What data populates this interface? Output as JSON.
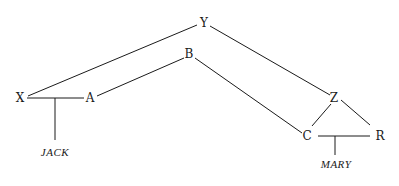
{
  "diagram": {
    "type": "graph",
    "nodes": {
      "X": {
        "label": "X",
        "x": 20,
        "y": 102
      },
      "A": {
        "label": "A",
        "x": 90,
        "y": 102
      },
      "Y": {
        "label": "Y",
        "x": 204,
        "y": 27
      },
      "B": {
        "label": "B",
        "x": 189,
        "y": 58
      },
      "Z": {
        "label": "Z",
        "x": 334,
        "y": 102
      },
      "C": {
        "label": "C",
        "x": 307,
        "y": 140
      },
      "R": {
        "label": "R",
        "x": 380,
        "y": 140
      }
    },
    "leaves": {
      "JACK": {
        "label": "JACK",
        "x": 55,
        "y": 156
      },
      "MARY": {
        "label": "MARY",
        "x": 336,
        "y": 168
      }
    },
    "edges": [
      {
        "from": "X",
        "to": "Y"
      },
      {
        "from": "X",
        "to": "A"
      },
      {
        "from": "A",
        "to": "B"
      },
      {
        "from": "B",
        "to": "C"
      },
      {
        "from": "Y",
        "to": "Z"
      },
      {
        "from": "Z",
        "to": "C"
      },
      {
        "from": "Z",
        "to": "R"
      },
      {
        "from": "C",
        "to": "R"
      },
      {
        "from": "X-A",
        "to": "JACK"
      },
      {
        "from": "C-R",
        "to": "MARY"
      }
    ]
  }
}
